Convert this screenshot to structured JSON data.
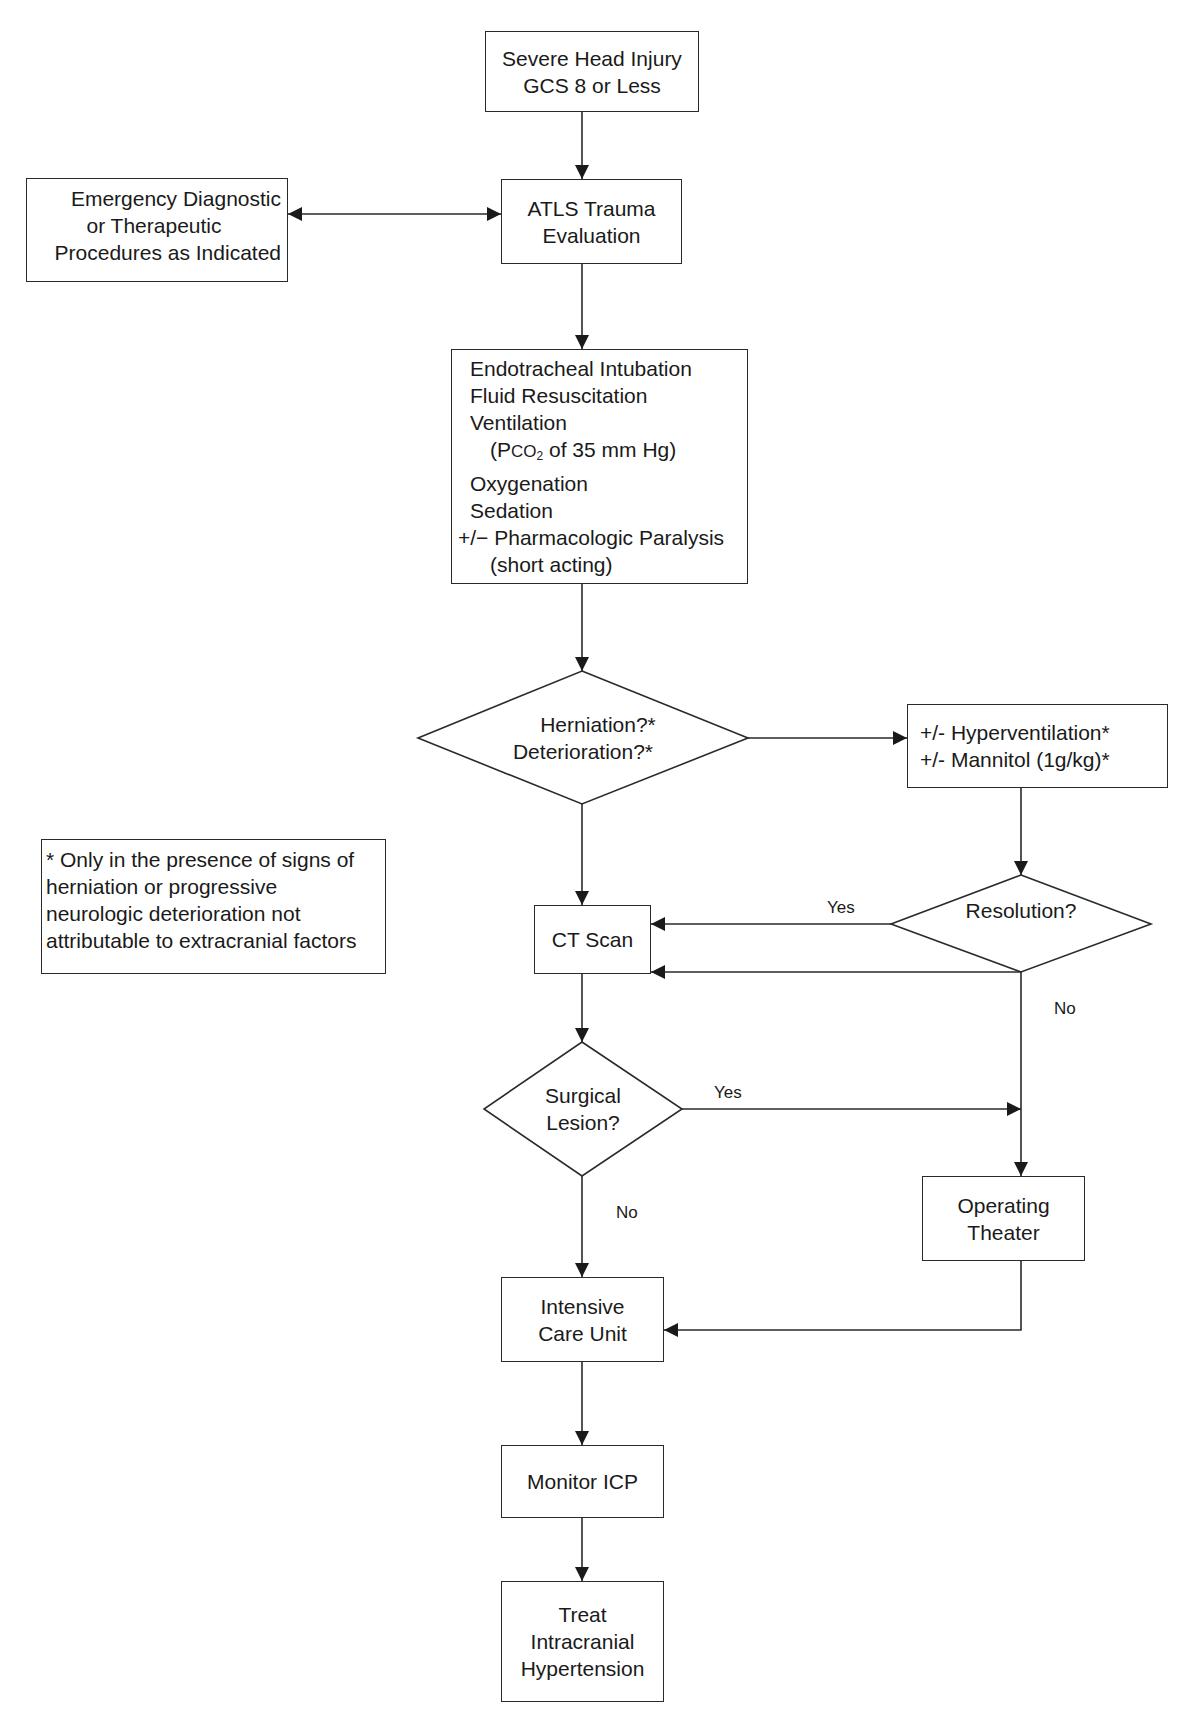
{
  "diagram": {
    "type": "flowchart",
    "nodes": {
      "start": {
        "lines": [
          "Severe Head Injury",
          "GCS 8 or Less"
        ]
      },
      "atls": {
        "lines": [
          "ATLS Trauma",
          "Evaluation"
        ]
      },
      "emergency": {
        "lines": [
          "Emergency Diagnostic",
          "or Therapeutic",
          "Procedures as Indicated"
        ]
      },
      "initial_management": {
        "lines": [
          "Endotracheal Intubation",
          "Fluid Resuscitation",
          "Ventilation",
          "(Pco2 of 35 mm Hg)",
          "Oxygenation",
          "Sedation",
          "+/− Pharmacologic Paralysis",
          "(short acting)"
        ],
        "ventilation_detail": {
          "prefix": "(P",
          "smallcaps": "CO",
          "subscript": "2",
          "suffix": " of 35 mm Hg)"
        }
      },
      "herniation_decision": {
        "lines": [
          "Herniation?*",
          "Deterioration?*"
        ]
      },
      "hyperventilation": {
        "lines": [
          "+/- Hyperventilation*",
          "+/- Mannitol (1g/kg)*"
        ]
      },
      "footnote": {
        "lines": [
          "* Only in the presence of signs of",
          "herniation or progressive",
          "neurologic deterioration not",
          "attributable to extracranial factors"
        ]
      },
      "ct_scan": {
        "lines": [
          "CT Scan"
        ]
      },
      "resolution_decision": {
        "lines": [
          "Resolution?"
        ]
      },
      "surgical_decision": {
        "lines": [
          "Surgical",
          "Lesion?"
        ]
      },
      "operating_theater": {
        "lines": [
          "Operating",
          "Theater"
        ]
      },
      "icu": {
        "lines": [
          "Intensive",
          "Care Unit"
        ]
      },
      "monitor_icp": {
        "lines": [
          "Monitor ICP"
        ]
      },
      "treat": {
        "lines": [
          "Treat",
          "Intracranial",
          "Hypertension"
        ]
      }
    },
    "edge_labels": {
      "resolution_yes": "Yes",
      "resolution_no": "No",
      "surgical_yes": "Yes",
      "surgical_no": "No"
    },
    "edges": [
      [
        "start",
        "atls"
      ],
      [
        "atls",
        "emergency",
        "bidirectional"
      ],
      [
        "atls",
        "initial_management"
      ],
      [
        "initial_management",
        "herniation_decision"
      ],
      [
        "herniation_decision",
        "hyperventilation"
      ],
      [
        "herniation_decision",
        "ct_scan"
      ],
      [
        "hyperventilation",
        "resolution_decision"
      ],
      [
        "resolution_decision",
        "ct_scan",
        "Yes"
      ],
      [
        "resolution_decision",
        "ct_scan"
      ],
      [
        "resolution_decision",
        "operating_theater",
        "No"
      ],
      [
        "ct_scan",
        "surgical_decision"
      ],
      [
        "surgical_decision",
        "operating_theater",
        "Yes"
      ],
      [
        "surgical_decision",
        "icu",
        "No"
      ],
      [
        "operating_theater",
        "icu"
      ],
      [
        "icu",
        "monitor_icp"
      ],
      [
        "monitor_icp",
        "treat"
      ]
    ],
    "colors": {
      "stroke": "#2a2a2a",
      "text": "#1a1a1a",
      "background": "#ffffff"
    }
  }
}
